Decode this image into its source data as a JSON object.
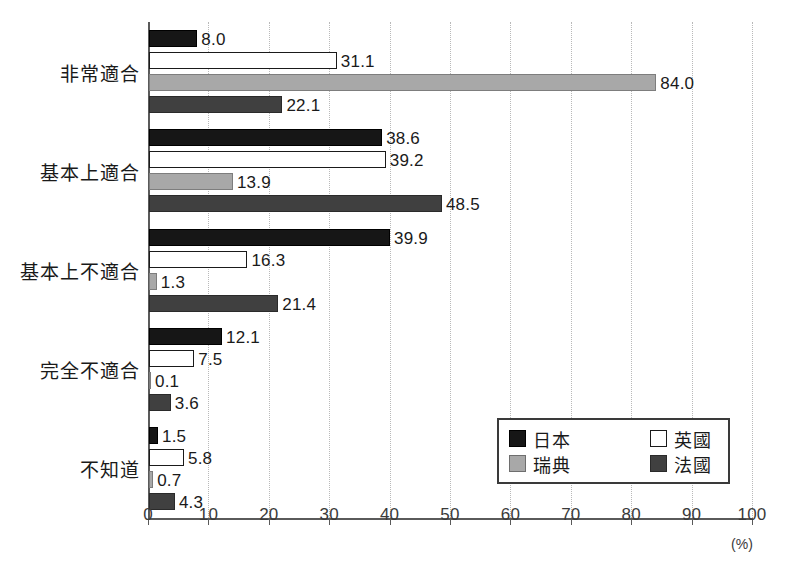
{
  "chart_data": {
    "type": "bar",
    "orientation": "horizontal",
    "title": "",
    "xlabel": "(%)",
    "ylabel": "",
    "xlim": [
      0,
      100
    ],
    "xticks": [
      "0",
      "10",
      "20",
      "30",
      "40",
      "50",
      "60",
      "70",
      "80",
      "90",
      "100"
    ],
    "grid": "vertical-dotted",
    "legend_position": "inside-lower-right",
    "categories": [
      "非常適合",
      "基本上適合",
      "基本上不適合",
      "完全不適合",
      "不知道"
    ],
    "series": [
      {
        "name": "日本",
        "color": "#161616",
        "values": [
          8.0,
          38.6,
          39.9,
          12.1,
          1.5
        ],
        "labels": [
          "8.0",
          "38.6",
          "39.9",
          "12.1",
          "1.5"
        ]
      },
      {
        "name": "英國",
        "color": "#ffffff",
        "values": [
          31.1,
          39.2,
          16.3,
          7.5,
          5.8
        ],
        "labels": [
          "31.1",
          "39.2",
          "16.3",
          "7.5",
          "5.8"
        ]
      },
      {
        "name": "瑞典",
        "color": "#a8a8a8",
        "values": [
          84.0,
          13.9,
          1.3,
          0.1,
          0.7
        ],
        "labels": [
          "84.0",
          "13.9",
          "1.3",
          "0.1",
          "0.7"
        ]
      },
      {
        "name": "法國",
        "color": "#404040",
        "values": [
          22.1,
          48.5,
          21.4,
          3.6,
          4.3
        ],
        "labels": [
          "22.1",
          "48.5",
          "21.4",
          "3.6",
          "4.3"
        ]
      }
    ]
  },
  "legend": {
    "entries": [
      {
        "label": "日本",
        "key": "japan"
      },
      {
        "label": "英國",
        "key": "uk"
      },
      {
        "label": "瑞典",
        "key": "sweden"
      },
      {
        "label": "法國",
        "key": "france"
      }
    ]
  },
  "axis": {
    "unit_label": "(%)"
  }
}
